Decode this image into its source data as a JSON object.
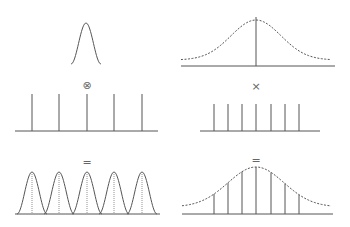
{
  "diagram": {
    "colors": {
      "stroke": "#555555",
      "background": "#ffffff"
    },
    "operators": {
      "left_middle": "⊗",
      "right_middle": "×",
      "left_bottom": "=",
      "right_bottom": "="
    },
    "left_column": {
      "top": {
        "label": "narrow-gaussian-pulse",
        "center_x": 86,
        "peak_y": 23,
        "base_y": 64,
        "half_width": 15
      },
      "middle": {
        "label": "impulse-train-wide",
        "baseline_y": 131,
        "x_start": 15,
        "x_end": 158,
        "spike_x": [
          32,
          59,
          87,
          114,
          142
        ],
        "spike_top": 94
      },
      "bottom": {
        "label": "periodic-gaussian-pulses",
        "baseline_y": 214,
        "centers": [
          32,
          59,
          87,
          114,
          142
        ],
        "peak_y": 172,
        "half_width": 15
      }
    },
    "right_column": {
      "top": {
        "label": "wide-dashed-gaussian-with-center-line",
        "center_x": 256,
        "peak_y": 20,
        "tail_y": 60,
        "baseline_y": 66,
        "x_start": 181,
        "x_end": 335
      },
      "middle": {
        "label": "impulse-train-narrow",
        "baseline_y": 131,
        "x_start": 200,
        "x_end": 320,
        "spike_x": [
          214,
          228,
          242,
          256,
          271,
          285,
          299
        ],
        "spike_top": 104
      },
      "bottom": {
        "label": "sampled-gaussian",
        "baseline_y": 214,
        "x_start": 182,
        "x_end": 333,
        "peak_y": 167,
        "tail_y": 207,
        "spike_x": [
          214,
          228,
          242,
          256,
          271,
          285,
          299
        ]
      }
    }
  }
}
